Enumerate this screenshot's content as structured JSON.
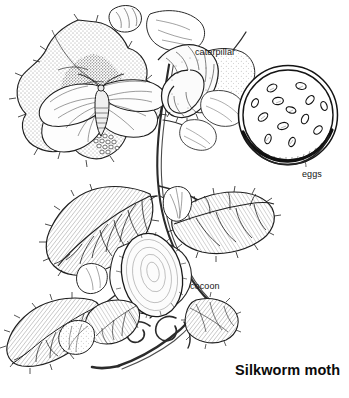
{
  "plate": {
    "title": "Silkworm moth",
    "medium": "pen-and-ink line and stipple drawing",
    "background_color": "#ffffff",
    "ink_color": "#161616",
    "subject": "silkworm-moth-life-cycle-on-mulberry-branch"
  },
  "labels": {
    "caterpillar": "caterpillar",
    "eggs": "eggs",
    "cocoon": "cocoon"
  },
  "figures": [
    {
      "name": "adult-moth",
      "description": "pale winged adult silkworm moth resting on a dark stippled mulberry leaf at upper left"
    },
    {
      "name": "egg-cluster-on-leaf",
      "description": "small cluster of pale eggs laid on the dark leaf beside the moth"
    },
    {
      "name": "caterpillar",
      "description": "large pale segmented silkworm larva feeding on a mulberry leaf at upper right"
    },
    {
      "name": "cocoon",
      "description": "large pale oval silk cocoon spun among the lower leaves"
    },
    {
      "name": "egg-dish",
      "description": "magnified circular inset dish containing scattered oval eggs"
    },
    {
      "name": "mulberry-branch",
      "description": "woody stem with serrated mulberry leaves running diagonally through the plate"
    }
  ],
  "egg_inset": {
    "shape": "circle",
    "center": [
      288,
      115
    ],
    "radius": 50,
    "ring_count": 2,
    "egg_count": 13
  }
}
